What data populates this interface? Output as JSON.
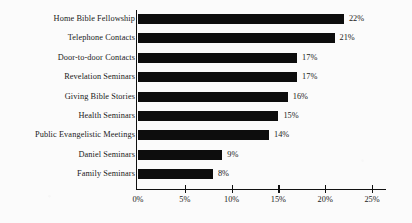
{
  "chart_data": {
    "type": "bar",
    "orientation": "horizontal",
    "title": "",
    "xlabel": "",
    "ylabel": "",
    "xlim": [
      0,
      25
    ],
    "grid": false,
    "legend": false,
    "value_suffix": "%",
    "categories": [
      "Home Bible Fellowship",
      "Telephone Contacts",
      "Door-to-door Contacts",
      "Revelation Seminars",
      "Giving Bible Stories",
      "Health Seminars",
      "Public Evangelistic Meetings",
      "Daniel Seminars",
      "Family Seminars"
    ],
    "values": [
      22,
      21,
      17,
      17,
      16,
      15,
      14,
      9,
      8
    ],
    "data_labels": [
      "22%",
      "21%",
      "17%",
      "17%",
      "16%",
      "15%",
      "14%",
      "9%",
      "8%"
    ],
    "xticks": [
      0,
      5,
      10,
      15,
      20,
      25
    ],
    "xtick_labels": [
      "0%",
      "5%",
      "10%",
      "15%",
      "20%",
      "25%"
    ],
    "bar_color": "#0d0d0d",
    "background_color": "#fbfbfb",
    "axis_color": "#111111"
  }
}
